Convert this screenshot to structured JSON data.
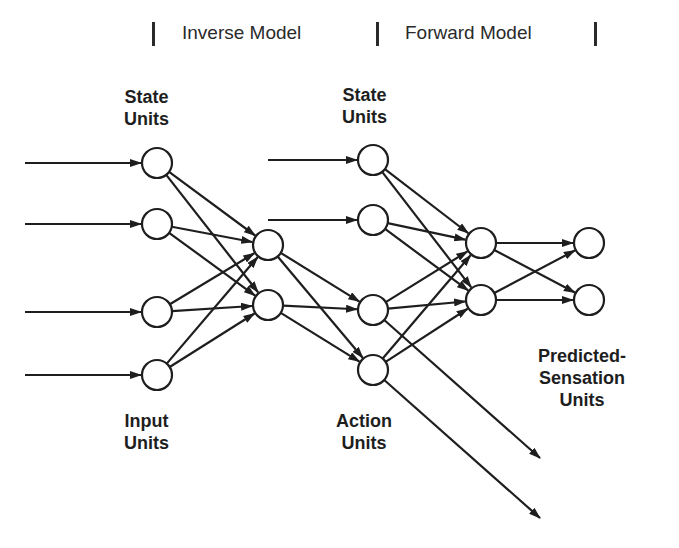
{
  "header": {
    "inverse_label": "Inverse Model",
    "forward_label": "Forward Model"
  },
  "labels": {
    "state_units_1": [
      "State",
      "Units"
    ],
    "state_units_2": [
      "State",
      "Units"
    ],
    "input_units": [
      "Input",
      "Units"
    ],
    "action_units": [
      "Action",
      "Units"
    ],
    "predicted_sensation_units": [
      "Predicted-",
      "Sensation",
      "Units"
    ]
  },
  "colors": {
    "stroke": "#1e1e1e",
    "node_fill": "#ffffff",
    "background": "#ffffff"
  },
  "network": {
    "node_radius": 15,
    "layers": [
      {
        "name": "input-layer",
        "x": 157,
        "ys": [
          163,
          224,
          312,
          375
        ]
      },
      {
        "name": "inverse-hidden-layer",
        "x": 268,
        "ys": [
          245,
          305
        ]
      },
      {
        "name": "state-action-layer",
        "x": 373,
        "ys": [
          160,
          220,
          310,
          370
        ]
      },
      {
        "name": "forward-hidden-layer",
        "x": 481,
        "ys": [
          243,
          300
        ]
      },
      {
        "name": "predicted-sensation-layer",
        "x": 589,
        "ys": [
          243,
          300
        ]
      }
    ],
    "external_inputs": [
      {
        "x1": 25,
        "y1": 163,
        "layer": 0,
        "node": 0
      },
      {
        "x1": 25,
        "y1": 224,
        "layer": 0,
        "node": 1
      },
      {
        "x1": 25,
        "y1": 312,
        "layer": 0,
        "node": 2
      },
      {
        "x1": 25,
        "y1": 375,
        "layer": 0,
        "node": 3
      },
      {
        "x1": 268,
        "y1": 160,
        "layer": 2,
        "node": 0
      },
      {
        "x1": 268,
        "y1": 220,
        "layer": 2,
        "node": 1
      }
    ],
    "fully_connected": [
      {
        "from": 0,
        "to": 1
      },
      {
        "from": 1,
        "to": 2,
        "to_nodes": [
          2,
          3
        ]
      },
      {
        "from": 2,
        "to": 3
      },
      {
        "from": 3,
        "to": 4
      }
    ],
    "action_outputs": [
      {
        "layer": 2,
        "node": 2,
        "x2": 540,
        "y2": 458
      },
      {
        "layer": 2,
        "node": 3,
        "x2": 540,
        "y2": 518
      }
    ]
  }
}
